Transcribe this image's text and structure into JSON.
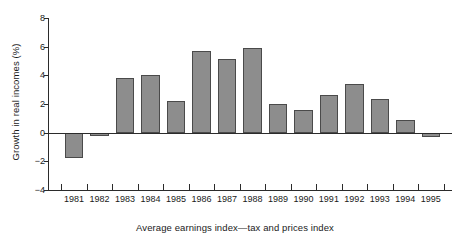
{
  "chart_data": {
    "type": "bar",
    "title": "",
    "subtitle": "",
    "xlabel": "Average earnings index—tax and prices index",
    "ylabel": "Growth in real incomes (%)",
    "categories": [
      "1981",
      "1982",
      "1983",
      "1984",
      "1985",
      "1986",
      "1987",
      "1988",
      "1989",
      "1990",
      "1991",
      "1992",
      "1993",
      "1994",
      "1995"
    ],
    "values": [
      -1.8,
      -0.25,
      3.8,
      4.05,
      2.2,
      5.7,
      5.15,
      5.9,
      2.0,
      1.6,
      2.65,
      3.4,
      2.35,
      0.85,
      -0.3
    ],
    "ylim": [
      -4,
      8
    ],
    "yticks": [
      -4,
      -2,
      0,
      2,
      4,
      6,
      8
    ],
    "ytick_labels": [
      "−4",
      "−2",
      "0",
      "2",
      "4",
      "6",
      "8"
    ],
    "grid": false,
    "legend": "none",
    "bar_color": "#8d8d8d",
    "bar_edge_color": "#4a4a4a",
    "axis_color": "#2b2b2b"
  }
}
